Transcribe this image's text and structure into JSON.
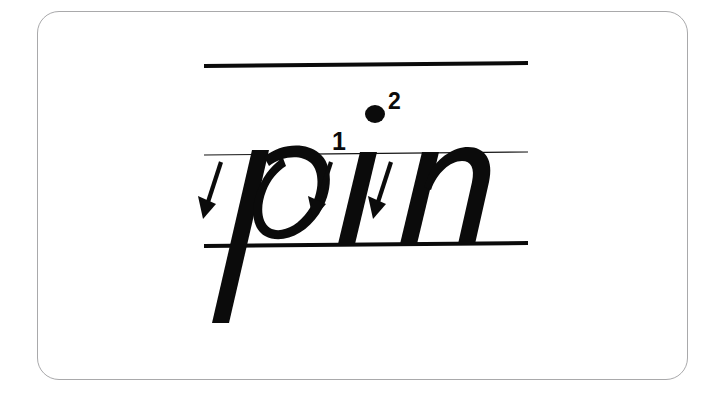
{
  "card": {
    "name": "handwriting-practice-card",
    "background_color": "#ffffff",
    "border_color": "#a9a9ab",
    "corner_radius": "22px"
  },
  "worksheet": {
    "word": "pin",
    "script_style": "italic lowercase",
    "ink_color": "#0b0b0b",
    "guide_lines": [
      {
        "name": "ascender-line",
        "weight": "heavy",
        "color": "#0b0b0b"
      },
      {
        "name": "x-height-line",
        "weight": "light",
        "color": "#141414"
      },
      {
        "name": "baseline",
        "weight": "heavy",
        "color": "#0b0b0b"
      }
    ],
    "letters": [
      {
        "name": "letter-p",
        "char": "p"
      },
      {
        "name": "letter-i",
        "char": "i"
      },
      {
        "name": "letter-n",
        "char": "n"
      }
    ],
    "stroke_arrows": [
      {
        "name": "stroke-arrow-p",
        "direction": "down-left",
        "for_letter": "p"
      },
      {
        "name": "stroke-arrow-i",
        "direction": "down-left",
        "for_letter": "i"
      },
      {
        "name": "stroke-arrow-n",
        "direction": "down-left",
        "for_letter": "n"
      }
    ],
    "stroke_order_labels": [
      {
        "name": "stroke-order-1",
        "value": "1",
        "for_letter": "i",
        "refers_to": "stem"
      },
      {
        "name": "stroke-order-2",
        "value": "2",
        "for_letter": "i",
        "refers_to": "tittle"
      }
    ],
    "tittle": {
      "name": "i-tittle-dot",
      "color": "#0b0b0b"
    }
  }
}
